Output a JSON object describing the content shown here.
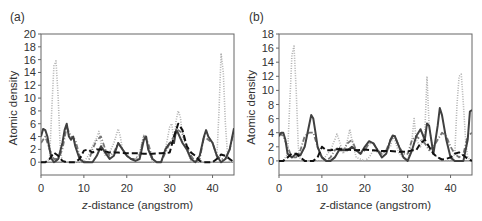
{
  "chart_data": [
    {
      "panel": "(a)",
      "type": "line",
      "title": "",
      "xlabel_italic": "z",
      "xlabel_rest": "-distance (angstrom)",
      "xlabel": "z-distance (angstrom)",
      "ylabel": "Atomic density",
      "xlim": [
        0,
        45
      ],
      "ylim": [
        -2,
        20
      ],
      "xticks": [
        0,
        10,
        20,
        30,
        40
      ],
      "yticks": [
        0,
        2,
        4,
        6,
        8,
        10,
        12,
        14,
        16,
        18,
        20
      ],
      "grid": false,
      "legend": "none",
      "series": [
        {
          "name": "dotted-light",
          "style": "dotted",
          "color": "#b0b0b0",
          "x": [
            0,
            1,
            2,
            2.5,
            3,
            3.5,
            4,
            4.5,
            5,
            6,
            8,
            10,
            11,
            12,
            13,
            13.5,
            14,
            15,
            16,
            17,
            18,
            18.5,
            19,
            20,
            21,
            22,
            23,
            24,
            24.5,
            25,
            26,
            27,
            28,
            29,
            30,
            30.5,
            31,
            31.5,
            32,
            32.5,
            33,
            34,
            35,
            36,
            37,
            38,
            39,
            40,
            41,
            41.5,
            42,
            42.5,
            43,
            43.5,
            44,
            45
          ],
          "y": [
            0,
            0,
            0.5,
            8,
            15,
            15.8,
            10,
            2,
            0,
            0,
            0,
            0,
            1,
            2.5,
            3.8,
            4.8,
            3,
            1,
            1.5,
            3,
            5.2,
            4,
            2,
            1,
            0.5,
            0.5,
            1.5,
            4.3,
            4,
            2,
            0,
            0,
            0,
            2,
            5.5,
            6,
            3,
            6.5,
            8,
            7,
            4,
            2,
            0,
            0,
            0,
            0,
            0,
            0,
            0.5,
            8,
            17,
            14,
            6,
            1,
            0,
            0
          ]
        },
        {
          "name": "dash-dot-grey",
          "style": "dashdot",
          "color": "#777777",
          "x": [
            0,
            1,
            2,
            3,
            4,
            5,
            6,
            7,
            8,
            9,
            10,
            11,
            12,
            13,
            14,
            15,
            16,
            17,
            18,
            19,
            20,
            21,
            22,
            23,
            24,
            25,
            26,
            27,
            28,
            29,
            30,
            31,
            32,
            33,
            34,
            35,
            36,
            37,
            38,
            39,
            40,
            41,
            42,
            43,
            44,
            45
          ],
          "y": [
            3,
            4,
            2,
            0.5,
            0.5,
            2,
            5.5,
            4,
            3.5,
            1,
            0,
            0,
            2,
            3.5,
            4,
            2,
            1,
            1.5,
            3,
            2,
            1,
            0.5,
            0.5,
            1,
            4,
            3,
            0.5,
            0,
            0,
            1.5,
            3,
            4,
            5,
            4.5,
            2.5,
            1,
            0,
            0.5,
            4,
            3.5,
            3,
            1,
            0.5,
            0.5,
            2,
            5
          ]
        },
        {
          "name": "solid-dark",
          "style": "solid",
          "color": "#404040",
          "x": [
            0,
            0.5,
            1,
            1.5,
            2,
            2.5,
            3,
            3.5,
            4,
            5,
            5.5,
            6,
            6.5,
            7,
            7.5,
            8,
            9,
            10,
            11,
            12,
            13,
            14,
            15,
            16,
            17,
            18,
            19,
            20,
            21,
            22,
            23,
            24,
            24.5,
            25,
            26,
            27,
            28,
            29,
            30,
            31,
            31.5,
            32,
            33,
            34,
            35,
            36,
            37,
            38,
            38.5,
            39,
            40,
            41,
            42,
            43,
            44,
            45
          ],
          "y": [
            4,
            5.2,
            5,
            4,
            2,
            0.5,
            0,
            0.2,
            0.5,
            3,
            5,
            6,
            4,
            3.5,
            4,
            2.5,
            0.5,
            0,
            0,
            0,
            1,
            2.5,
            1.5,
            0.5,
            1,
            3,
            2,
            1,
            0.5,
            0.2,
            0.5,
            3.5,
            4,
            2,
            0.5,
            0,
            0,
            2,
            3,
            3,
            5,
            4.5,
            3,
            2,
            0.5,
            0,
            1,
            4,
            5,
            4,
            3,
            1,
            0,
            0.5,
            2,
            5.3
          ]
        },
        {
          "name": "dashed-black",
          "style": "dashed",
          "color": "#111111",
          "x": [
            0,
            1,
            2,
            3,
            4,
            5,
            6,
            8,
            9,
            10,
            11,
            12,
            13,
            14,
            15,
            16,
            18,
            20,
            22,
            24,
            26,
            28,
            30,
            31,
            32,
            33,
            34,
            35,
            36,
            37,
            38,
            39,
            40,
            41,
            42,
            43,
            44,
            45
          ],
          "y": [
            0,
            0,
            0.5,
            1.5,
            1,
            0.2,
            0,
            0,
            0.5,
            1.8,
            2,
            1.5,
            2,
            2,
            1.7,
            1.5,
            1.5,
            1.4,
            1.4,
            1.3,
            1.3,
            1.4,
            1.5,
            4,
            6,
            5,
            2.5,
            1.5,
            1,
            0.2,
            0,
            0,
            0,
            0.5,
            1.2,
            1,
            0.5,
            0
          ]
        }
      ]
    },
    {
      "panel": "(b)",
      "type": "line",
      "title": "",
      "xlabel": "z-distance (angstrom)",
      "ylabel": "Atomic density",
      "xlim": [
        0,
        45
      ],
      "ylim": [
        -2,
        18
      ],
      "xticks": [
        0,
        10,
        20,
        30,
        40
      ],
      "yticks": [
        0,
        2,
        4,
        6,
        8,
        10,
        12,
        14,
        16,
        18
      ],
      "grid": false,
      "legend": "none",
      "series": [
        {
          "name": "dotted-light",
          "style": "dotted",
          "color": "#b0b0b0",
          "x": [
            0,
            1,
            2,
            2.5,
            3,
            3.5,
            4,
            4.5,
            5,
            6,
            8,
            10,
            12,
            13,
            13.5,
            14,
            15,
            16,
            16.5,
            17,
            18,
            20,
            21,
            22,
            24,
            26,
            26.5,
            27,
            28,
            30,
            31,
            31.5,
            32,
            33,
            34,
            34.5,
            35,
            36,
            38,
            40,
            41,
            41.5,
            42,
            42.5,
            43,
            43.5,
            44,
            45
          ],
          "y": [
            0,
            0,
            1,
            8,
            15,
            16.3,
            10,
            2,
            0,
            0,
            0,
            0,
            1.5,
            3,
            3.8,
            3,
            1,
            3,
            4.5,
            3,
            0.5,
            0,
            0.5,
            1.5,
            1,
            2,
            3.5,
            3,
            1,
            0,
            3,
            6,
            3,
            2,
            4,
            12,
            5,
            1,
            0,
            0,
            1,
            8,
            12,
            12.3,
            8,
            3,
            0.5,
            0
          ]
        },
        {
          "name": "dash-dot-grey",
          "style": "dashdot",
          "color": "#777777",
          "x": [
            0,
            1,
            2,
            3,
            4,
            5,
            6,
            7,
            8,
            9,
            10,
            11,
            12,
            13,
            14,
            15,
            16,
            17,
            18,
            19,
            20,
            21,
            22,
            23,
            24,
            25,
            26,
            27,
            28,
            29,
            30,
            31,
            32,
            33,
            34,
            35,
            36,
            37,
            38,
            39,
            40,
            41,
            42,
            43,
            44,
            45
          ],
          "y": [
            4,
            3.5,
            2,
            0.5,
            0.5,
            1.5,
            3.5,
            4,
            4,
            2,
            0.5,
            0,
            0.5,
            1.5,
            2,
            1.5,
            2.5,
            3,
            1.5,
            1,
            1.5,
            2.5,
            2.5,
            1.5,
            1,
            1.5,
            3,
            3.5,
            2,
            1,
            1,
            3,
            3.5,
            3,
            2.5,
            1.5,
            2,
            3,
            4,
            3.5,
            2,
            1,
            0.5,
            1,
            3.5,
            4
          ]
        },
        {
          "name": "solid-dark",
          "style": "solid",
          "color": "#404040",
          "x": [
            0,
            0.5,
            1,
            1.5,
            2,
            3,
            4,
            5,
            6,
            7,
            7.5,
            8,
            8.5,
            9,
            10,
            11,
            12,
            13,
            14,
            15,
            16,
            17,
            18,
            19,
            20,
            21,
            22,
            23,
            24,
            25,
            26,
            26.5,
            27,
            28,
            29,
            30,
            31,
            32,
            33,
            34,
            34.5,
            35,
            36,
            37,
            37.5,
            38,
            39,
            40,
            41,
            42,
            43,
            44,
            44.5,
            45
          ],
          "y": [
            3.5,
            4,
            4,
            3,
            1,
            0.5,
            1,
            0.8,
            2,
            5,
            6.5,
            6,
            4,
            2,
            0.5,
            0,
            0,
            0.5,
            1.5,
            1.5,
            1.5,
            2,
            1.5,
            1,
            2,
            2.8,
            2.5,
            1.5,
            0.5,
            1,
            3,
            3.6,
            3.5,
            2,
            0.5,
            0,
            1.5,
            3.5,
            4.5,
            3,
            5.3,
            5,
            1,
            5,
            7.5,
            6.5,
            3,
            0.5,
            0,
            0,
            0,
            3,
            7,
            7.2
          ]
        },
        {
          "name": "dashed-black",
          "style": "dashed",
          "color": "#111111",
          "x": [
            0,
            1,
            2,
            3,
            4,
            5,
            6,
            7,
            8,
            9,
            10,
            11,
            12,
            14,
            16,
            18,
            20,
            22,
            24,
            26,
            28,
            30,
            31,
            32,
            33,
            34,
            35,
            36,
            37,
            38,
            39,
            40,
            41,
            42,
            43,
            44,
            45
          ],
          "y": [
            0,
            0,
            0.5,
            1,
            1,
            0.5,
            0,
            0,
            0,
            0.5,
            2,
            1.5,
            1.5,
            1.7,
            1.6,
            1.5,
            1.6,
            1.5,
            1.4,
            1.4,
            1.3,
            1.3,
            1.5,
            1.5,
            2.5,
            3,
            2,
            1,
            0.5,
            0.2,
            0.3,
            0.5,
            1,
            1.2,
            0.8,
            0.3,
            0
          ]
        }
      ]
    }
  ],
  "panels": {
    "a": {
      "label": "(a)"
    },
    "b": {
      "label": "(b)"
    }
  }
}
